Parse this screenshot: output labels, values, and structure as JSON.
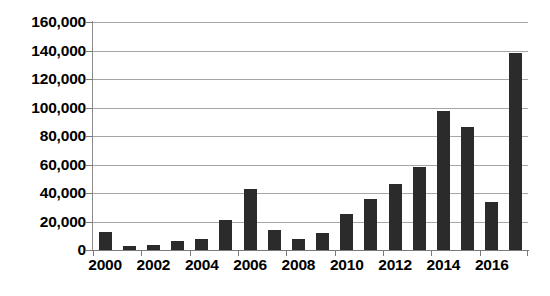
{
  "chart_data": {
    "type": "bar",
    "title": "",
    "subtitle": "",
    "xlabel": "",
    "ylabel": "",
    "categories": [
      "2000",
      "2001",
      "2002",
      "2003",
      "2004",
      "2005",
      "2006",
      "2007",
      "2008",
      "2009",
      "2010",
      "2011",
      "2012",
      "2013",
      "2014",
      "2015",
      "2016",
      "2017"
    ],
    "values": [
      12500,
      2500,
      3500,
      6500,
      7500,
      21000,
      43000,
      14000,
      7500,
      12000,
      25000,
      35500,
      46500,
      58500,
      97500,
      86000,
      34000,
      138500
    ],
    "xtick_labels": [
      "2000",
      "2002",
      "2004",
      "2006",
      "2008",
      "2010",
      "2012",
      "2014",
      "2016"
    ],
    "xtick_categories": [
      "2000",
      "2002",
      "2004",
      "2006",
      "2008",
      "2010",
      "2012",
      "2014",
      "2016"
    ],
    "ytick_labels": [
      "0",
      "20,000",
      "40,000",
      "60,000",
      "80,000",
      "100,000",
      "120,000",
      "140,000",
      "160,000"
    ],
    "ytick_values": [
      0,
      20000,
      40000,
      60000,
      80000,
      100000,
      120000,
      140000,
      160000
    ],
    "ylim": [
      0,
      160000
    ],
    "grid": true,
    "grid_axis": "y",
    "legend": null,
    "legend_position": "none",
    "bar_color": "#2b2b2b",
    "gridline_color": "#a6a6a6",
    "axis_color": "#7a7a7a",
    "background_color": "#ffffff"
  }
}
